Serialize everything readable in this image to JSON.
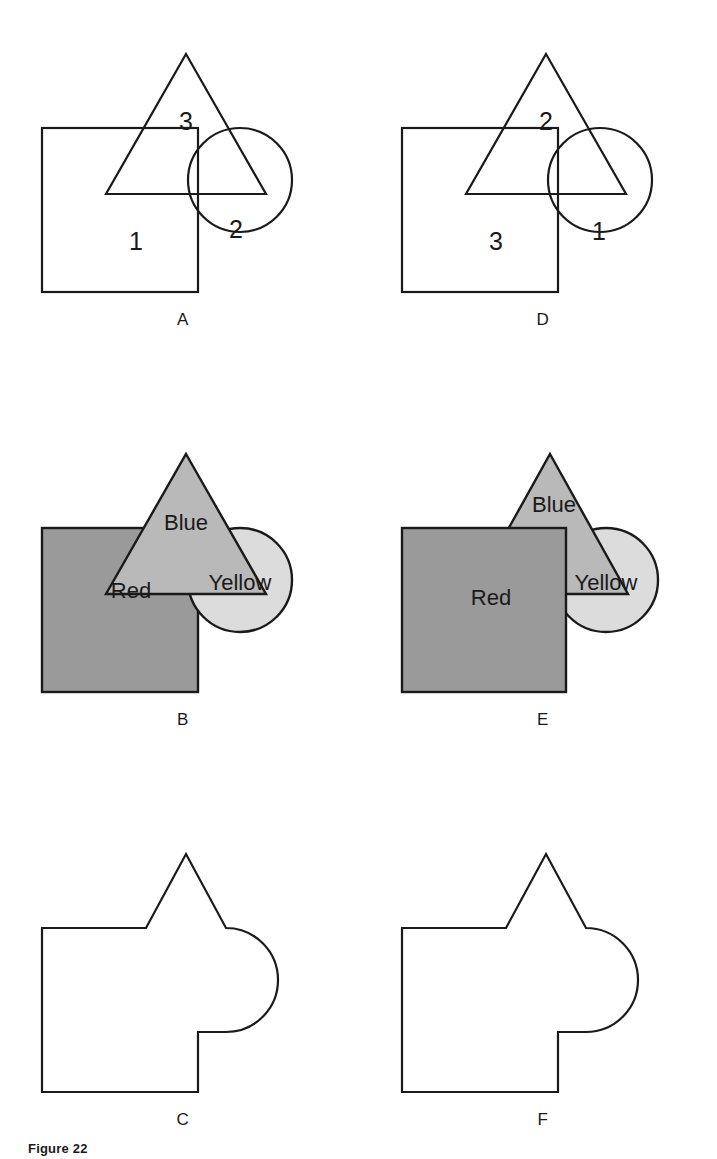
{
  "figure": {
    "caption": "Figure 22",
    "panel_count": 6
  },
  "palette": {
    "ink": "#1a1a1a",
    "page": "#ffffff",
    "red_square_fill": "#9a9a9a",
    "blue_triangle_fill": "#b9b9b9",
    "yellow_circle_fill": "#dcdcdc"
  },
  "panels": [
    {
      "id": "A",
      "label": "A",
      "kind": "outline-numbered",
      "layer_order": [
        "square",
        "circle",
        "triangle"
      ],
      "regions": [
        {
          "name": "square",
          "text": "1",
          "x": 118,
          "y": 228
        },
        {
          "name": "circle",
          "text": "2",
          "x": 218,
          "y": 216
        },
        {
          "name": "triangle",
          "text": "3",
          "x": 168,
          "y": 108
        }
      ]
    },
    {
      "id": "D",
      "label": "D",
      "kind": "outline-numbered",
      "layer_order": [
        "square",
        "circle",
        "triangle"
      ],
      "regions": [
        {
          "name": "circle",
          "text": "1",
          "x": 221,
          "y": 218
        },
        {
          "name": "triangle",
          "text": "2",
          "x": 168,
          "y": 108
        },
        {
          "name": "square",
          "text": "3",
          "x": 118,
          "y": 228
        }
      ]
    },
    {
      "id": "B",
      "label": "B",
      "kind": "shaded-named",
      "layer_order": [
        "square",
        "circle",
        "triangle"
      ],
      "regions": [
        {
          "name": "square",
          "text": "Red",
          "x": 113,
          "y": 176
        },
        {
          "name": "circle",
          "text": "Yellow",
          "x": 222,
          "y": 168
        },
        {
          "name": "triangle",
          "text": "Blue",
          "x": 168,
          "y": 108
        }
      ]
    },
    {
      "id": "E",
      "label": "E",
      "kind": "shaded-named",
      "layer_order": [
        "circle",
        "triangle",
        "square"
      ],
      "regions": [
        {
          "name": "circle",
          "text": "Yellow",
          "x": 228,
          "y": 168
        },
        {
          "name": "triangle",
          "text": "Blue",
          "x": 176,
          "y": 90
        },
        {
          "name": "square",
          "text": "Red",
          "x": 113,
          "y": 176
        }
      ]
    },
    {
      "id": "C",
      "label": "C",
      "kind": "union-outline",
      "layer_order": [
        "union"
      ],
      "regions": []
    },
    {
      "id": "F",
      "label": "F",
      "kind": "union-outline",
      "layer_order": [
        "union"
      ],
      "regions": []
    }
  ],
  "geometry": {
    "square": {
      "x": 24,
      "y": 106,
      "width": 156,
      "height": 164
    },
    "circle": {
      "cx": 222,
      "cy": 158,
      "r": 52
    },
    "triangle": {
      "apex_x": 168,
      "apex_y": 32,
      "left_x": 88,
      "right_x": 248,
      "base_y": 172
    },
    "union_path": "M 24 106 L 128 106 L 168 32 L 208 106 A 52 52 0 1 1 208 210 L 180 210 L 180 270 L 24 270 Z"
  }
}
